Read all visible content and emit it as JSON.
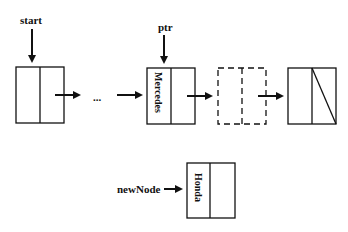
{
  "diagram": {
    "type": "linked-list-insertion",
    "pointers": {
      "start": "start",
      "ptr": "ptr",
      "new_node": "newNode"
    },
    "ellipsis": "...",
    "nodes": [
      {
        "id": "first",
        "data": "",
        "style": "solid"
      },
      {
        "id": "mercedes",
        "data": "Mercedes",
        "style": "solid"
      },
      {
        "id": "next",
        "data": "",
        "style": "dashed"
      },
      {
        "id": "last",
        "data": "",
        "style": "solid",
        "null_link": true
      },
      {
        "id": "honda",
        "data": "Honda",
        "style": "solid",
        "detached": true
      }
    ],
    "colors": {
      "stroke": "#111111",
      "background": "#ffffff"
    }
  }
}
